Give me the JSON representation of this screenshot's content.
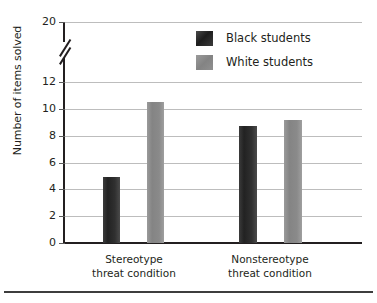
{
  "chart_data": {
    "type": "bar",
    "title": "",
    "subtitle": "",
    "xlabel": "",
    "ylabel": "Number of items solved",
    "categories": [
      "Stereotype threat condition",
      "Nonstereotype threat condition"
    ],
    "category_lines": [
      [
        "Stereotype",
        "threat condition"
      ],
      [
        "Nonstereotype",
        "threat condition"
      ]
    ],
    "series": [
      {
        "name": "Black students",
        "color": "#2a2a2a",
        "values": [
          4.9,
          8.7
        ]
      },
      {
        "name": "White students",
        "color": "#8a8a8a",
        "values": [
          10.5,
          9.2
        ]
      }
    ],
    "ylim": [
      0,
      20
    ],
    "y_ticks": [
      0,
      2,
      4,
      6,
      8,
      10,
      12,
      20
    ],
    "y_tick_labels": [
      "0",
      "2",
      "4",
      "6",
      "8",
      "10",
      "12",
      "20"
    ],
    "axis_break": true,
    "axis_break_between": [
      12,
      20
    ],
    "grid": true,
    "grid_axis": "y",
    "legend_position": "top-right",
    "legend": [
      "Black students",
      "White students"
    ]
  },
  "axis": {
    "y_title": "Number of items solved",
    "ticks": [
      {
        "label": "20",
        "value": 20
      },
      {
        "label": "12",
        "value": 12
      },
      {
        "label": "10",
        "value": 10
      },
      {
        "label": "8",
        "value": 8
      },
      {
        "label": "6",
        "value": 6
      },
      {
        "label": "4",
        "value": 4
      },
      {
        "label": "2",
        "value": 2
      },
      {
        "label": "0",
        "value": 0
      }
    ]
  },
  "legend": {
    "items": [
      {
        "label": "Black students",
        "color": "#2a2a2a"
      },
      {
        "label": "White students",
        "color": "#8a8a8a"
      }
    ]
  },
  "categories": [
    {
      "line1": "Stereotype",
      "line2": "threat condition"
    },
    {
      "line1": "Nonstereotype",
      "line2": "threat condition"
    }
  ],
  "colors": {
    "dark_bar": "#2a2a2a",
    "light_bar": "#8a8a8a",
    "axis": "#231f20",
    "grid": "#bdbdbd",
    "background": "#ffffff"
  }
}
